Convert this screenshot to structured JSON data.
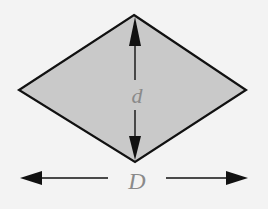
{
  "diagram": {
    "type": "rhombus-diagonals",
    "shape": {
      "name": "rhombus",
      "vertices": {
        "top": [
          134,
          15
        ],
        "right": [
          246,
          90
        ],
        "bottom": [
          135,
          162
        ],
        "left": [
          19,
          90
        ]
      },
      "fill": "#c9c9c9",
      "stroke": "#111111"
    },
    "labels": {
      "short_diagonal": "d",
      "long_diagonal": "D"
    },
    "arrows": {
      "vertical": {
        "from": [
          135,
          20
        ],
        "to": [
          135,
          158
        ],
        "label_ref": "d"
      },
      "horizontal": {
        "from": [
          20,
          178
        ],
        "to": [
          248,
          178
        ],
        "label_ref": "D"
      }
    },
    "colors": {
      "background": "#f3f3f3",
      "label": "#8a8a8a",
      "arrow": "#111111"
    }
  }
}
